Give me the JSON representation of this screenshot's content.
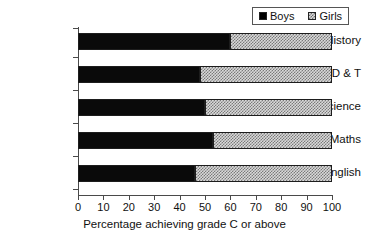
{
  "chart_data": {
    "type": "bar",
    "orientation": "horizontal",
    "stacked": true,
    "title": "",
    "xlabel": "Percentage achieving grade C or above",
    "ylabel": "",
    "xlim": [
      0,
      100
    ],
    "xticks": [
      0,
      10,
      20,
      30,
      40,
      50,
      60,
      70,
      80,
      90,
      100
    ],
    "xtick_labels": [
      "0",
      "10",
      "20",
      "30",
      "40",
      "50",
      "60",
      "70",
      "80",
      "90",
      "100"
    ],
    "grid": false,
    "legend_position": "top-right",
    "categories": [
      "History",
      "D & T",
      "Science",
      "Maths",
      "English"
    ],
    "series": [
      {
        "name": "Boys",
        "values": [
          60,
          48,
          50,
          53,
          46
        ],
        "color": "#0a0a0a",
        "pattern": "solid"
      },
      {
        "name": "Girls",
        "values": [
          40,
          52,
          50,
          47,
          54
        ],
        "color": "#d9d9d9",
        "pattern": "hatched"
      }
    ]
  },
  "legend": {
    "entries": [
      {
        "label": "Boys",
        "swatch": "solid-black-square-icon"
      },
      {
        "label": "Girls",
        "swatch": "hatched-square-icon"
      }
    ]
  },
  "axis": {
    "x_title": "Percentage achieving grade C or above"
  }
}
